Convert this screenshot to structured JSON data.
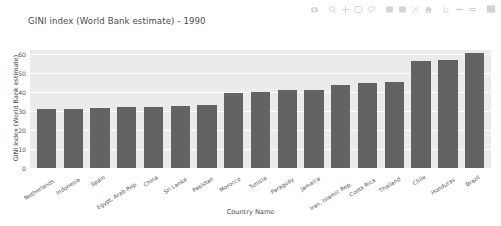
{
  "modebar": {
    "buttons": [
      {
        "name": "download-plot-camera-icon",
        "label": "Download plot as a png"
      },
      {
        "name": "zoom-icon",
        "label": "Zoom"
      },
      {
        "name": "pan-icon",
        "label": "Pan"
      },
      {
        "name": "box-select-icon",
        "label": "Box Select"
      },
      {
        "name": "lasso-select-icon",
        "label": "Lasso Select"
      },
      {
        "name": "zoom-in-icon",
        "label": "Zoom in"
      },
      {
        "name": "zoom-out-icon",
        "label": "Zoom out"
      },
      {
        "name": "autoscale-icon",
        "label": "Autoscale"
      },
      {
        "name": "reset-axes-home-icon",
        "label": "Reset axes"
      },
      {
        "name": "toggle-spike-lines-icon",
        "label": "Toggle Spike Lines"
      },
      {
        "name": "hover-compare-data-icon",
        "label": "Show closest data on hover"
      },
      {
        "name": "hover-closest-data-icon",
        "label": "Compare data on hover"
      },
      {
        "name": "plotly-logo-icon",
        "label": "Produced with Plotly"
      }
    ]
  },
  "chart_data": {
    "type": "bar",
    "title": "GINI index (World Bank estimate) - 1990",
    "xlabel": "Country Name",
    "ylabel": "GINI index (World Bank estimate)",
    "ylim": [
      0,
      62
    ],
    "yticks": [
      0,
      10,
      20,
      30,
      40,
      50,
      60
    ],
    "grid": true,
    "legend": false,
    "bar_color": "#636363",
    "plot_bgcolor": "#ebebeb",
    "paper_bgcolor": "#ffffff",
    "gridcolor": "#ffffff",
    "categories": [
      "Netherlands",
      "Indonesia",
      "Spain",
      "Egypt, Arab Rep.",
      "China",
      "Sri Lanka",
      "Pakistan",
      "Morocco",
      "Tunisia",
      "Paraguay",
      "Jamaica",
      "Iran, Islamic Rep.",
      "Costa Rica",
      "Thailand",
      "Chile",
      "Honduras",
      "Brazil"
    ],
    "values": [
      30.9,
      31.2,
      31.5,
      31.8,
      32.2,
      32.4,
      33.2,
      39.2,
      40.2,
      40.8,
      41.1,
      43.6,
      44.8,
      45.0,
      56.2,
      56.8,
      60.5
    ]
  }
}
